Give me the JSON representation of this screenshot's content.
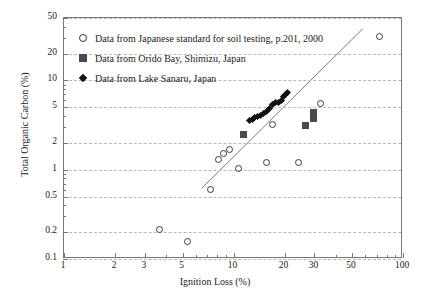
{
  "chart_data": {
    "type": "scatter",
    "title": "",
    "xlabel": "Ignition Loss (%)",
    "ylabel": "Total Organic Carbon (%)",
    "xscale": "log",
    "yscale": "log",
    "xlim": [
      1,
      100
    ],
    "ylim": [
      0.1,
      50
    ],
    "grid": true,
    "legend_position": "upper-left",
    "xticks": [
      "1",
      "2",
      "3",
      "5",
      "10",
      "20",
      "30",
      "50",
      "100"
    ],
    "xtick_values": [
      1,
      2,
      3,
      5,
      10,
      20,
      30,
      50,
      100
    ],
    "yticks": [
      "0.1",
      "0.2",
      "0.5",
      "1",
      "2",
      "5",
      "10",
      "20",
      "50"
    ],
    "ytick_values": [
      0.1,
      0.2,
      0.5,
      1,
      2,
      5,
      10,
      20,
      50
    ],
    "series": [
      {
        "name": "Data from Japanese standard for soil testing, p.201, 2000",
        "marker": "open-circle",
        "color": "#3a3a3a",
        "points": [
          {
            "x": 3.6,
            "y": 0.22
          },
          {
            "x": 5.3,
            "y": 0.16
          },
          {
            "x": 7.2,
            "y": 0.62
          },
          {
            "x": 8.0,
            "y": 1.35
          },
          {
            "x": 8.6,
            "y": 1.55
          },
          {
            "x": 9.3,
            "y": 1.75
          },
          {
            "x": 10.6,
            "y": 1.05
          },
          {
            "x": 15.5,
            "y": 1.25
          },
          {
            "x": 16.8,
            "y": 3.3
          },
          {
            "x": 24.0,
            "y": 1.25
          },
          {
            "x": 32.0,
            "y": 5.6
          },
          {
            "x": 72.0,
            "y": 32.0
          }
        ]
      },
      {
        "name": "Data from Orido Bay, Shimizu, Japan",
        "marker": "filled-square",
        "color": "#4a4a4a",
        "points": [
          {
            "x": 11.5,
            "y": 2.5
          },
          {
            "x": 26.5,
            "y": 3.1
          },
          {
            "x": 29.5,
            "y": 4.0
          }
        ]
      },
      {
        "name": "Data from Lake Sanaru, Japan",
        "marker": "filled-diamond",
        "color": "#111111",
        "points": [
          {
            "x": 12.4,
            "y": 3.6
          },
          {
            "x": 12.9,
            "y": 3.7
          },
          {
            "x": 13.3,
            "y": 3.8
          },
          {
            "x": 13.9,
            "y": 3.9
          },
          {
            "x": 14.4,
            "y": 4.1
          },
          {
            "x": 15.0,
            "y": 4.3
          },
          {
            "x": 15.6,
            "y": 4.5
          },
          {
            "x": 16.2,
            "y": 4.9
          },
          {
            "x": 17.0,
            "y": 5.4
          },
          {
            "x": 17.6,
            "y": 5.6
          },
          {
            "x": 18.3,
            "y": 5.7
          },
          {
            "x": 19.2,
            "y": 5.9
          },
          {
            "x": 19.8,
            "y": 6.6
          },
          {
            "x": 20.3,
            "y": 7.0
          },
          {
            "x": 20.8,
            "y": 7.3
          }
        ]
      }
    ],
    "trendline": {
      "type": "straight-fit-line",
      "color": "#7a7a7a",
      "x_start": 6.5,
      "y_start": 0.62,
      "x_end": 58.0,
      "y_end": 38.0
    },
    "annotations": []
  }
}
